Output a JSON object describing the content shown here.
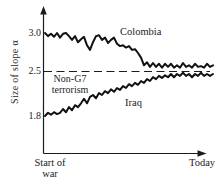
{
  "figure": {
    "background": "#ffffff",
    "ink_color": "#1c1c1c"
  },
  "chart_data": {
    "type": "line",
    "title": "",
    "ylabel": "Size of slope α",
    "xlabel": "",
    "x_start_label": "Start of war",
    "x_end_label": "Today",
    "ytick_labels": [
      "3.0",
      "2.5",
      "1.8"
    ],
    "ytick_values": [
      3.0,
      2.5,
      1.8
    ],
    "ylim": [
      1.55,
      3.15
    ],
    "grid": false,
    "legend_position": "inline-annotations",
    "reference_line": {
      "value": 2.5,
      "style": "dashed",
      "label": "Non-G7 terrorism"
    },
    "series": [
      {
        "name": "Colombia",
        "values": [
          3.0,
          2.96,
          2.99,
          2.95,
          3.0,
          2.94,
          2.99,
          3.0,
          2.96,
          2.91,
          2.96,
          2.88,
          2.92,
          2.95,
          2.84,
          2.78,
          2.88,
          2.96,
          2.97,
          2.91,
          2.94,
          2.87,
          2.91,
          2.94,
          2.86,
          2.83,
          2.84,
          2.81,
          2.83,
          2.78,
          2.79,
          2.74,
          2.68,
          2.58,
          2.62,
          2.56,
          2.61,
          2.56,
          2.6,
          2.55,
          2.6,
          2.56,
          2.6,
          2.55,
          2.58,
          2.55,
          2.61,
          2.56,
          2.58,
          2.55,
          2.6,
          2.56,
          2.57,
          2.55,
          2.6,
          2.56,
          2.58
        ]
      },
      {
        "name": "Iraq",
        "values": [
          1.8,
          1.85,
          1.82,
          1.86,
          1.83,
          1.85,
          1.91,
          1.86,
          1.94,
          1.89,
          1.97,
          1.94,
          2.0,
          2.07,
          2.0,
          2.1,
          2.13,
          2.08,
          2.16,
          2.13,
          2.19,
          2.16,
          2.22,
          2.18,
          2.24,
          2.21,
          2.27,
          2.24,
          2.3,
          2.27,
          2.32,
          2.29,
          2.35,
          2.32,
          2.38,
          2.35,
          2.41,
          2.38,
          2.43,
          2.4,
          2.44,
          2.41,
          2.46,
          2.41,
          2.46,
          2.43,
          2.48,
          2.43,
          2.46,
          2.41,
          2.46,
          2.43,
          2.48,
          2.43,
          2.46,
          2.43,
          2.46
        ]
      }
    ]
  }
}
